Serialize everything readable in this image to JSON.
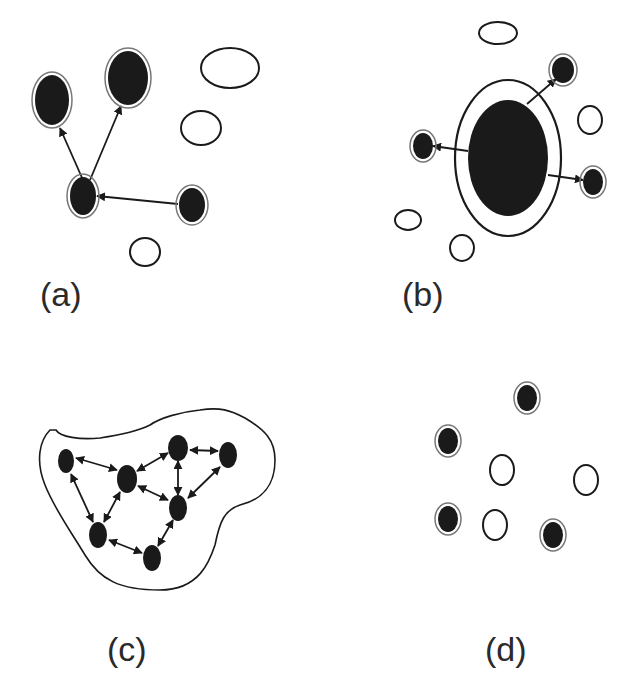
{
  "figure": {
    "panels": [
      {
        "id": "a",
        "label": "(a)",
        "nodes": [
          {
            "x": 52,
            "y": 100,
            "rx": 17,
            "ry": 25,
            "filled": true,
            "ring": true
          },
          {
            "x": 128,
            "y": 78,
            "rx": 20,
            "ry": 27,
            "filled": true,
            "ring": true
          },
          {
            "x": 83,
            "y": 196,
            "rx": 13,
            "ry": 19,
            "filled": true,
            "ring": true
          },
          {
            "x": 192,
            "y": 205,
            "rx": 13,
            "ry": 17,
            "filled": true,
            "ring": true
          },
          {
            "x": 230,
            "y": 68,
            "rx": 29,
            "ry": 20,
            "filled": false
          },
          {
            "x": 201,
            "y": 128,
            "rx": 20,
            "ry": 17,
            "filled": false
          },
          {
            "x": 145,
            "y": 252,
            "rx": 15,
            "ry": 14,
            "filled": false
          }
        ],
        "edges": [
          {
            "from": [
              83,
              180
            ],
            "to": [
              60,
              128
            ]
          },
          {
            "from": [
              90,
              180
            ],
            "to": [
              121,
              106
            ]
          },
          {
            "from": [
              178,
              204
            ],
            "to": [
              97,
              196
            ]
          }
        ]
      },
      {
        "id": "b",
        "label": "(b)",
        "nodes": [
          {
            "x": 508,
            "y": 158,
            "rx": 50,
            "ry": 75,
            "filled": true,
            "ring": true,
            "inner_rx": 40,
            "inner_ry": 58
          },
          {
            "x": 563,
            "y": 70,
            "rx": 11,
            "ry": 13,
            "filled": true,
            "ring": true
          },
          {
            "x": 423,
            "y": 146,
            "rx": 10,
            "ry": 13,
            "filled": true,
            "ring": true
          },
          {
            "x": 593,
            "y": 182,
            "rx": 10,
            "ry": 13,
            "filled": true,
            "ring": true
          },
          {
            "x": 498,
            "y": 33,
            "rx": 19,
            "ry": 11,
            "filled": false
          },
          {
            "x": 590,
            "y": 120,
            "rx": 12,
            "ry": 14,
            "filled": false
          },
          {
            "x": 408,
            "y": 220,
            "rx": 13,
            "ry": 10,
            "filled": false
          },
          {
            "x": 462,
            "y": 248,
            "rx": 12,
            "ry": 13,
            "filled": false
          }
        ],
        "edges": [
          {
            "from": [
              527,
              104
            ],
            "to": [
              556,
              79
            ]
          },
          {
            "from": [
              468,
              151
            ],
            "to": [
              433,
              146
            ]
          },
          {
            "from": [
              548,
              175
            ],
            "to": [
              583,
              180
            ]
          }
        ]
      },
      {
        "id": "c",
        "label": "(c)",
        "nodes": [
          {
            "x": 66,
            "y": 461,
            "rx": 8,
            "ry": 12,
            "filled": true
          },
          {
            "x": 127,
            "y": 479,
            "rx": 10,
            "ry": 14,
            "filled": true
          },
          {
            "x": 178,
            "y": 448,
            "rx": 10,
            "ry": 13,
            "filled": true
          },
          {
            "x": 228,
            "y": 455,
            "rx": 9,
            "ry": 13,
            "filled": true
          },
          {
            "x": 178,
            "y": 508,
            "rx": 9,
            "ry": 13,
            "filled": true
          },
          {
            "x": 98,
            "y": 535,
            "rx": 9,
            "ry": 13,
            "filled": true
          },
          {
            "x": 152,
            "y": 558,
            "rx": 9,
            "ry": 13,
            "filled": true
          }
        ],
        "edges": [
          {
            "from": [
              117,
              470
            ],
            "to": [
              76,
              458
            ],
            "bidirectional": true
          },
          {
            "from": [
              137,
              471
            ],
            "to": [
              168,
              453
            ],
            "bidirectional": true
          },
          {
            "from": [
              190,
              450
            ],
            "to": [
              218,
              451
            ],
            "bidirectional": true
          },
          {
            "from": [
              178,
              461
            ],
            "to": [
              178,
              495
            ],
            "bidirectional": true
          },
          {
            "from": [
              220,
              467
            ],
            "to": [
              188,
              498
            ],
            "bidirectional": true
          },
          {
            "from": [
              138,
              486
            ],
            "to": [
              168,
              500
            ],
            "bidirectional": true
          },
          {
            "from": [
              71,
              474
            ],
            "to": [
              93,
              522
            ],
            "bidirectional": true
          },
          {
            "from": [
              120,
              492
            ],
            "to": [
              104,
              522
            ],
            "bidirectional": true
          },
          {
            "from": [
              173,
              520
            ],
            "to": [
              158,
              546
            ],
            "bidirectional": true
          },
          {
            "from": [
              142,
              553
            ],
            "to": [
              109,
              540
            ],
            "bidirectional": true
          }
        ]
      },
      {
        "id": "d",
        "label": "(d)",
        "nodes": [
          {
            "x": 527,
            "y": 398,
            "rx": 10,
            "ry": 13,
            "filled": true,
            "ring": true
          },
          {
            "x": 448,
            "y": 441,
            "rx": 10,
            "ry": 13,
            "filled": true,
            "ring": true
          },
          {
            "x": 448,
            "y": 519,
            "rx": 10,
            "ry": 13,
            "filled": true,
            "ring": true
          },
          {
            "x": 553,
            "y": 535,
            "rx": 10,
            "ry": 13,
            "filled": true,
            "ring": true
          },
          {
            "x": 502,
            "y": 470,
            "rx": 12,
            "ry": 15,
            "filled": false
          },
          {
            "x": 586,
            "y": 480,
            "rx": 12,
            "ry": 15,
            "filled": false
          },
          {
            "x": 495,
            "y": 525,
            "rx": 12,
            "ry": 15,
            "filled": false
          }
        ],
        "edges": []
      }
    ],
    "colors": {
      "ink": "#1a1a1a",
      "ring": "#777777",
      "background": "#ffffff"
    }
  }
}
